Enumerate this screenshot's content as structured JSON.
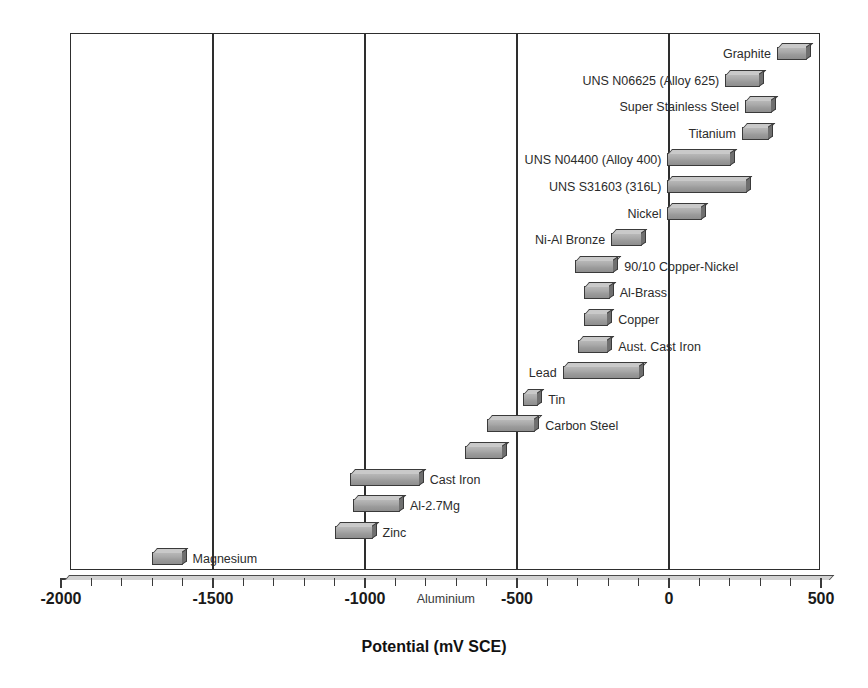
{
  "chart_data": {
    "type": "bar",
    "orientation": "horizontal-range",
    "title": "",
    "xlabel": "Potential (mV SCE)",
    "ylabel": "",
    "xlim": [
      -2000,
      500
    ],
    "xticks": [
      -2000,
      -1500,
      -1000,
      -500,
      0,
      500
    ],
    "xtick_labels": [
      "-2000",
      "-1500",
      "-1000",
      "-500",
      "0",
      "500"
    ],
    "minor_tick_step": 100,
    "gridlines_at": [
      -1500,
      -1000,
      -500,
      0
    ],
    "grid": true,
    "legend": "none",
    "annotations": [
      {
        "text": "Aluminium",
        "x": -830,
        "placement": "on-axis"
      }
    ],
    "categories": [
      "Graphite",
      "UNS N06625 (Alloy 625)",
      "Super Stainless Steel",
      "Titanium",
      "UNS N04400 (Alloy 400)",
      "UNS S31603 (316L)",
      "Nickel",
      "Ni-Al Bronze",
      "90/10 Copper-Nickel",
      "Al-Brass",
      "Copper",
      "Aust. Cast Iron",
      "Lead",
      "Tin",
      "Carbon Steel",
      "Aluminium",
      "Cast Iron",
      "Al-2.7Mg",
      "Zinc",
      "Magnesium"
    ],
    "bars": [
      {
        "label": "Graphite",
        "min": 355,
        "max": 455,
        "label_side": "left"
      },
      {
        "label": "UNS N06625 (Alloy 625)",
        "min": 185,
        "max": 300,
        "label_side": "left"
      },
      {
        "label": "Super Stainless Steel",
        "min": 250,
        "max": 340,
        "label_side": "left"
      },
      {
        "label": "Titanium",
        "min": 240,
        "max": 330,
        "label_side": "left"
      },
      {
        "label": "UNS N04400 (Alloy 400)",
        "min": -5,
        "max": 205,
        "label_side": "left"
      },
      {
        "label": "UNS S31603 (316L)",
        "min": -5,
        "max": 255,
        "label_side": "left"
      },
      {
        "label": "Nickel",
        "min": -5,
        "max": 110,
        "label_side": "left"
      },
      {
        "label": "Ni-Al Bronze",
        "min": -190,
        "max": -90,
        "label_side": "left"
      },
      {
        "label": "90/10 Copper-Nickel",
        "min": -310,
        "max": -180,
        "label_side": "right"
      },
      {
        "label": "Al-Brass",
        "min": -280,
        "max": -195,
        "label_side": "right"
      },
      {
        "label": "Copper",
        "min": -280,
        "max": -200,
        "label_side": "right"
      },
      {
        "label": "Aust. Cast Iron",
        "min": -300,
        "max": -200,
        "label_side": "right"
      },
      {
        "label": "Lead",
        "min": -350,
        "max": -95,
        "label_side": "left"
      },
      {
        "label": "Tin",
        "min": -480,
        "max": -430,
        "label_side": "right"
      },
      {
        "label": "Carbon Steel",
        "min": -600,
        "max": -440,
        "label_side": "right"
      },
      {
        "label": "",
        "min": -670,
        "max": -545,
        "label_side": "none"
      },
      {
        "label": "Cast Iron",
        "min": -1050,
        "max": -820,
        "label_side": "right"
      },
      {
        "label": "Al-2.7Mg",
        "min": -1040,
        "max": -885,
        "label_side": "right"
      },
      {
        "label": "Zinc",
        "min": -1100,
        "max": -975,
        "label_side": "right"
      },
      {
        "label": "Magnesium",
        "min": -1700,
        "max": -1600,
        "label_side": "right"
      }
    ]
  },
  "axis": {
    "title": "Potential (mV SCE)",
    "tick_labels": [
      "-2000",
      "-1500",
      "-1000",
      "-500",
      "0",
      "500"
    ],
    "inline_label": "Aluminium"
  },
  "colors": {
    "bar_face": "#a8a8a8",
    "bar_top": "#c9c9c9",
    "bar_side": "#6f6f6f",
    "outline": "#3a3a3a",
    "frame": "#2e2e2e",
    "text": "#1a1a1a"
  }
}
